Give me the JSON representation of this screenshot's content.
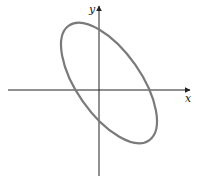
{
  "figure": {
    "x_axis_label": "x",
    "y_axis_label": "y",
    "colors": {
      "axes": "#222222",
      "ellipse": "#7a7a7a",
      "background": "#ffffff"
    },
    "ellipse": {
      "center_px": [
        109,
        83
      ],
      "semi_major_px": 70,
      "semi_minor_px": 32,
      "rotation_deg": 55,
      "orientation": "major axis tilted from upper-left to lower-right"
    }
  }
}
